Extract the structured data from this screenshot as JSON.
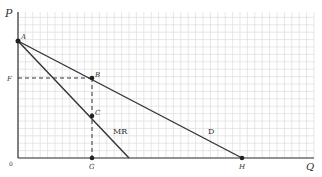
{
  "diagram": {
    "type": "monopoly-demand-marginal-revenue",
    "axes": {
      "y_label": "P",
      "x_label": "Q",
      "origin_label": "0"
    },
    "points": {
      "A": "A",
      "B": "B",
      "C": "C",
      "F": "F",
      "G": "G",
      "H": "H"
    },
    "curves": {
      "demand": "D",
      "marginal_revenue": "MR"
    },
    "colors": {
      "grid": "#d9d9d9",
      "line": "#333333",
      "background": "#ffffff"
    }
  }
}
